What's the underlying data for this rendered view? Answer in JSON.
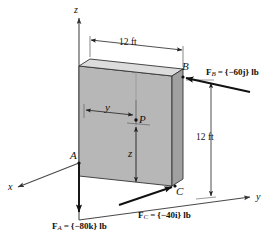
{
  "figure": {
    "axes": {
      "z_label": "z",
      "y_label": "y",
      "x_label": "x"
    },
    "points": {
      "A": "A",
      "B": "B",
      "C": "C",
      "P": "P"
    },
    "dimensions": {
      "top_width": "12 ft",
      "right_height": "12 ft",
      "horizontal_to_P": "y",
      "vertical_to_P": "z"
    },
    "forces": [
      {
        "name": "F_A",
        "symbol": "F",
        "subscript": "A",
        "equals": "=",
        "value": "{−80k} lb",
        "magnitude": -80,
        "direction": "k",
        "units": "lb",
        "full_text": "F_A = {−80k} lb"
      },
      {
        "name": "F_B",
        "symbol": "F",
        "subscript": "B",
        "equals": "=",
        "value": "{−60j} lb",
        "magnitude": -60,
        "direction": "j",
        "units": "lb",
        "full_text": "F_B = {−60j} lb"
      },
      {
        "name": "F_C",
        "symbol": "F",
        "subscript": "C",
        "equals": "=",
        "value": "{−40i} lb",
        "magnitude": -40,
        "direction": "i",
        "units": "lb",
        "full_text": "F_C = {−40i} lb"
      }
    ],
    "colors": {
      "plate_face": "#b4b4b4",
      "plate_top": "#d8d8d8",
      "plate_side": "#9a9a9a",
      "line": "#1a1a1a",
      "thin_line": "#555555",
      "background": "#ffffff"
    }
  }
}
